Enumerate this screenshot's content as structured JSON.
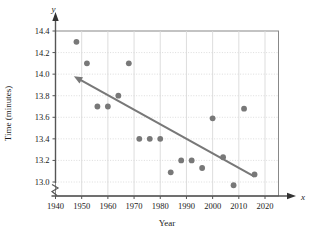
{
  "chart_data": {
    "type": "scatter",
    "title": "",
    "xlabel": "Year",
    "ylabel": "Time (minutes)",
    "x_axis_name": "x",
    "y_axis_name": "y",
    "xlim": [
      1938,
      2022
    ],
    "ylim": [
      12.92,
      14.45
    ],
    "xticks": [
      1940,
      1950,
      1960,
      1970,
      1980,
      1990,
      2000,
      2010,
      2020
    ],
    "yticks": [
      13.0,
      13.2,
      13.4,
      13.6,
      13.8,
      14.0,
      14.2,
      14.4
    ],
    "xtick_labels": [
      "1940",
      "1950",
      "1960",
      "1970",
      "1980",
      "1990",
      "2000",
      "2010",
      "2020"
    ],
    "ytick_labels": [
      "13.0",
      "13.2",
      "13.4",
      "13.6",
      "13.8",
      "14.0",
      "14.2",
      "14.4"
    ],
    "grid": true,
    "legend": "none",
    "y_axis_break": true,
    "point_color": "#787878",
    "line_color": "#787878",
    "grid_color": "#d9d9d9",
    "frame_color": "#888888",
    "points": [
      {
        "x": 1948,
        "y": 14.3
      },
      {
        "x": 1952,
        "y": 14.1
      },
      {
        "x": 1956,
        "y": 13.7
      },
      {
        "x": 1960,
        "y": 13.7
      },
      {
        "x": 1964,
        "y": 13.8
      },
      {
        "x": 1968,
        "y": 14.1
      },
      {
        "x": 1972,
        "y": 13.4
      },
      {
        "x": 1976,
        "y": 13.4
      },
      {
        "x": 1980,
        "y": 13.4
      },
      {
        "x": 1984,
        "y": 13.09
      },
      {
        "x": 1988,
        "y": 13.2
      },
      {
        "x": 1992,
        "y": 13.2
      },
      {
        "x": 1996,
        "y": 13.13
      },
      {
        "x": 2000,
        "y": 13.59
      },
      {
        "x": 2004,
        "y": 13.23
      },
      {
        "x": 2008,
        "y": 12.97
      },
      {
        "x": 2012,
        "y": 13.68
      },
      {
        "x": 2016,
        "y": 13.07
      }
    ],
    "trend_line": {
      "x_start": 2016,
      "y_start": 13.05,
      "x_end": 1947,
      "y_end": 13.98,
      "arrow_at": "end"
    }
  }
}
